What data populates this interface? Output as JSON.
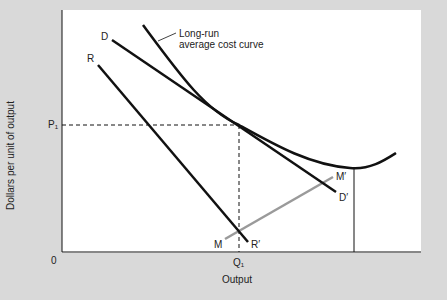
{
  "diagram": {
    "type": "economics-cost-curve",
    "axes": {
      "xlabel": "Output",
      "ylabel": "Dollars per unit of output",
      "origin": "0",
      "x_tick": "Q₁",
      "y_tick": "P₁"
    },
    "curves": {
      "lrac_label_line1": "Long-run",
      "lrac_label_line2": "average cost curve",
      "demand_start": "D",
      "demand_end": "D′",
      "r_start": "R",
      "r_end": "R′",
      "m_start": "M",
      "m_end": "M′"
    },
    "colors": {
      "background": "#d9d9d9",
      "plot": "#ffffff",
      "line": "#111111",
      "m_line": "#9a9a9a"
    }
  }
}
